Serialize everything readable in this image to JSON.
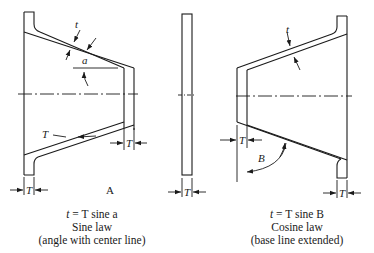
{
  "figure": {
    "left": {
      "labels": {
        "t": "t",
        "a": "a",
        "T_slant": "T",
        "T_right": "T",
        "T_bottom": "T",
        "letter": "A"
      },
      "caption": {
        "equation_lhs": "t",
        "equation_rhs": " = T sine a",
        "law": "Sine law",
        "note": "(angle with center line)"
      }
    },
    "middle": {
      "labels": {
        "T": "T"
      }
    },
    "right": {
      "labels": {
        "t": "t",
        "B": "B",
        "T_left": "T",
        "T_bottom": "T"
      },
      "caption": {
        "equation_lhs": "t",
        "equation_rhs": " = T sine B",
        "law": "Cosine law",
        "note": "(base line extended)"
      }
    },
    "colors": {
      "ink": "#1a1a1a",
      "background": "#ffffff"
    }
  }
}
